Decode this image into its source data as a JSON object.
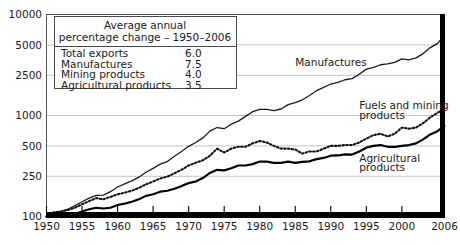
{
  "chart_data": {
    "type": "line",
    "title": "",
    "xlabel": "",
    "ylabel": "",
    "y_scale": "log",
    "ylim": [
      100,
      10000
    ],
    "xlim": [
      1950,
      2006
    ],
    "grid": true,
    "legend_position": "top-left-box",
    "y_ticks": [
      "10000",
      "5000",
      "2500",
      "1000",
      "500",
      "250",
      "100"
    ],
    "y_tick_values": [
      10000,
      5000,
      2500,
      1000,
      500,
      250,
      100
    ],
    "x_ticks": [
      "1950",
      "1955",
      "1960",
      "1965",
      "1970",
      "1975",
      "1980",
      "1985",
      "1990",
      "1995",
      "2000",
      "2006"
    ],
    "x_tick_values": [
      1950,
      1955,
      1960,
      1965,
      1970,
      1975,
      1980,
      1985,
      1990,
      1995,
      2000,
      2006
    ],
    "x": [
      1950,
      1951,
      1952,
      1953,
      1954,
      1955,
      1956,
      1957,
      1958,
      1959,
      1960,
      1961,
      1962,
      1963,
      1964,
      1965,
      1966,
      1967,
      1968,
      1969,
      1970,
      1971,
      1972,
      1973,
      1974,
      1975,
      1976,
      1977,
      1978,
      1979,
      1980,
      1981,
      1982,
      1983,
      1984,
      1985,
      1986,
      1987,
      1988,
      1989,
      1990,
      1991,
      1992,
      1993,
      1994,
      1995,
      1996,
      1997,
      1998,
      1999,
      2000,
      2001,
      2002,
      2003,
      2004,
      2005,
      2006
    ],
    "series": [
      {
        "name": "Manufactures",
        "style": "thin-solid",
        "annual_percent_change": 7.5,
        "values": [
          100,
          108,
          112,
          118,
          128,
          140,
          152,
          162,
          163,
          176,
          196,
          210,
          225,
          245,
          274,
          300,
          330,
          350,
          395,
          440,
          495,
          540,
          600,
          700,
          760,
          740,
          820,
          880,
          980,
          1090,
          1150,
          1150,
          1120,
          1160,
          1280,
          1340,
          1430,
          1580,
          1760,
          1900,
          2050,
          2130,
          2260,
          2320,
          2560,
          2880,
          2990,
          3180,
          3250,
          3360,
          3640,
          3560,
          3720,
          4100,
          4700,
          5150,
          6200
        ]
      },
      {
        "name": "Fuels and mining products",
        "style": "dotted",
        "annual_percent_change": 4.0,
        "values": [
          100,
          110,
          112,
          116,
          122,
          132,
          142,
          152,
          148,
          156,
          166,
          172,
          180,
          192,
          208,
          222,
          238,
          248,
          268,
          290,
          320,
          340,
          360,
          400,
          470,
          430,
          470,
          490,
          490,
          530,
          560,
          540,
          500,
          470,
          470,
          460,
          420,
          440,
          440,
          470,
          500,
          500,
          510,
          510,
          540,
          590,
          640,
          660,
          620,
          660,
          760,
          740,
          760,
          840,
          960,
          1060,
          1180
        ]
      },
      {
        "name": "Agricultural products",
        "style": "thick-solid",
        "annual_percent_change": 3.5,
        "values": [
          100,
          104,
          104,
          104,
          106,
          112,
          118,
          122,
          120,
          122,
          130,
          134,
          140,
          148,
          160,
          166,
          176,
          180,
          188,
          200,
          214,
          222,
          240,
          270,
          290,
          286,
          300,
          320,
          320,
          330,
          350,
          350,
          340,
          340,
          350,
          340,
          348,
          352,
          370,
          380,
          400,
          402,
          412,
          410,
          440,
          480,
          500,
          510,
          490,
          490,
          500,
          510,
          530,
          580,
          650,
          700,
          790
        ]
      }
    ],
    "annotations": [
      {
        "text": "Manufactures",
        "x": 1985,
        "y": 3100
      },
      {
        "text": "Fuels and mining",
        "x": 1994,
        "y": 1150
      },
      {
        "text": "products",
        "x": 1994,
        "y": 930
      },
      {
        "text": "Agricultural",
        "x": 1994,
        "y": 350
      },
      {
        "text": "products",
        "x": 1994,
        "y": 285
      }
    ]
  },
  "legend": {
    "title_line1": "Average annual",
    "title_line2": "percentage change – 1950–2006",
    "rows": [
      {
        "label": "Total exports",
        "value": "6.0"
      },
      {
        "label": "Manufactures",
        "value": "7.5"
      },
      {
        "label": "Mining products",
        "value": "4.0"
      },
      {
        "label": "Agricultural products",
        "value": "3.5"
      }
    ]
  },
  "series_labels": {
    "manufactures": "Manufactures",
    "fuels_line1": "Fuels and mining",
    "fuels_line2": "products",
    "agricultural_line1": "Agricultural",
    "agricultural_line2": "products"
  },
  "axis": {
    "y_labels": [
      "10000",
      "5000",
      "2500",
      "1000",
      "500",
      "250",
      "100"
    ],
    "x_labels": [
      "1950",
      "1955",
      "1960",
      "1965",
      "1970",
      "1975",
      "1980",
      "1985",
      "1990",
      "1995",
      "2000",
      "2006"
    ]
  },
  "colors": {
    "ink": "#000000",
    "grid": "#b4b4b4",
    "frame": "#555555",
    "background": "#ffffff"
  }
}
